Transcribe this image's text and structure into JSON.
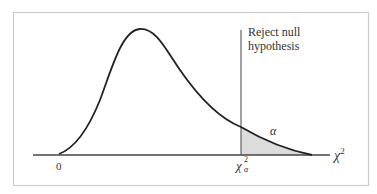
{
  "figure": {
    "type": "chi-square distribution with rejection region",
    "annotation": {
      "line1": "Reject null",
      "line2": "hypothesis"
    },
    "tail_area_label": "α",
    "x_axis": {
      "label": "χ",
      "label_superscript": "2",
      "origin_label": "0"
    },
    "critical_value": {
      "symbol": "χ",
      "subscript": "α",
      "superscript": "2"
    },
    "colors": {
      "curve": "#222222",
      "axis": "#444444",
      "frame": "#cccccc",
      "shaded_region": "#dcdcdc",
      "critical_line": "#555555"
    }
  }
}
